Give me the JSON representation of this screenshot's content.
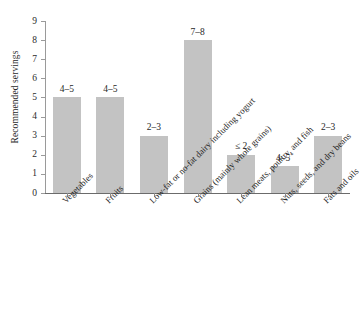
{
  "chart_data": {
    "type": "bar",
    "title": "",
    "xlabel": "",
    "ylabel": "Recommended servings",
    "ylim": [
      0,
      9
    ],
    "grid": false,
    "legend": "none",
    "orientation": "vertical",
    "bar_color": "#c3c3c3",
    "categories": [
      "Vegetables",
      "Fruits",
      "Low-fat or no-fat dairy including yogurt",
      "Grains (mainly whole grains)",
      "Lean meats, poultry, and fish",
      "Nuts, seeds, and dry beans",
      "Fats and oils"
    ],
    "values": [
      5,
      5,
      3,
      8,
      2,
      1.4,
      3
    ],
    "data_labels": [
      "4–5",
      "4–5",
      "2–3",
      "7–8",
      "≤ 2",
      "4–5*",
      "2–3"
    ],
    "data_label_notes": [
      "",
      "",
      "",
      "",
      "",
      "per week",
      ""
    ],
    "ytick_labels": [
      "0",
      "1",
      "2",
      "3",
      "4",
      "5",
      "6",
      "7",
      "8",
      "9"
    ],
    "ytick_values": [
      0,
      1,
      2,
      3,
      4,
      5,
      6,
      7,
      8,
      9
    ]
  }
}
